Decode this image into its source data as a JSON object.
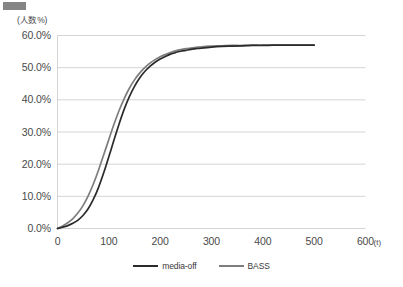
{
  "figure": {
    "redaction_bar": "redacted-block",
    "background_color": "#ffffff"
  },
  "chart_data": {
    "type": "line",
    "title": "",
    "subtitle": "",
    "xlabel": "(t)",
    "ylabel": "(人数%)",
    "xlim": [
      0,
      600
    ],
    "ylim": [
      0,
      60
    ],
    "xticks": [
      "0",
      "100",
      "200",
      "300",
      "400",
      "500",
      "600"
    ],
    "xtick_values": [
      0,
      100,
      200,
      300,
      400,
      500,
      600
    ],
    "yticks": [
      "0.0%",
      "10.0%",
      "20.0%",
      "30.0%",
      "40.0%",
      "50.0%",
      "60.0%"
    ],
    "ytick_values": [
      0,
      10,
      20,
      30,
      40,
      50,
      60
    ],
    "grid": "horizontal",
    "legend_position": "bottom-center",
    "x": [
      0,
      10,
      20,
      30,
      40,
      50,
      60,
      70,
      80,
      90,
      100,
      110,
      120,
      130,
      140,
      150,
      160,
      170,
      180,
      190,
      200,
      210,
      220,
      230,
      240,
      250,
      260,
      270,
      280,
      300,
      320,
      340,
      360,
      380,
      400,
      420,
      440,
      460,
      480,
      500
    ],
    "series": [
      {
        "name": "media-off",
        "color": "#2b2b2b",
        "values": [
          0.0,
          0.4,
          0.9,
          1.6,
          2.6,
          4.1,
          6.2,
          9.1,
          12.8,
          17.3,
          22.3,
          27.5,
          32.5,
          37.1,
          41.0,
          44.2,
          46.8,
          48.8,
          50.4,
          51.7,
          52.7,
          53.5,
          54.2,
          54.7,
          55.1,
          55.4,
          55.7,
          55.9,
          56.1,
          56.4,
          56.6,
          56.7,
          56.8,
          56.9,
          56.9,
          57.0,
          57.0,
          57.0,
          57.0,
          57.0
        ]
      },
      {
        "name": "BASS",
        "color": "#7d7d7d",
        "values": [
          0.0,
          0.8,
          1.8,
          3.1,
          4.9,
          7.2,
          10.2,
          13.9,
          18.2,
          22.9,
          27.7,
          32.4,
          36.7,
          40.4,
          43.6,
          46.2,
          48.3,
          50.0,
          51.4,
          52.5,
          53.4,
          54.1,
          54.7,
          55.2,
          55.6,
          55.9,
          56.1,
          56.3,
          56.5,
          56.7,
          56.8,
          56.9,
          56.9,
          57.0,
          57.0,
          57.0,
          57.0,
          57.0,
          57.0,
          57.0
        ]
      }
    ]
  },
  "legend": {
    "items": [
      {
        "label": "media-off",
        "color": "#2b2b2b"
      },
      {
        "label": "BASS",
        "color": "#7d7d7d"
      }
    ]
  }
}
